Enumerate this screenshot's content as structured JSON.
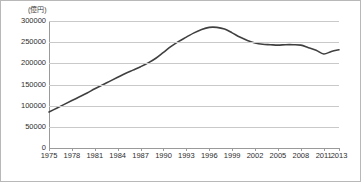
{
  "chart_data": {
    "type": "line",
    "title": "",
    "subtitle": "",
    "unit_label": "(億円)",
    "xlabel": "",
    "ylabel": "",
    "ylim": [
      0,
      300000
    ],
    "ytick_values": [
      0,
      50000,
      100000,
      150000,
      200000,
      250000,
      300000
    ],
    "ytick_labels": [
      "0",
      "50000",
      "100000",
      "150000",
      "200000",
      "250000",
      "300000"
    ],
    "xlim": [
      1975,
      2013
    ],
    "xtick_labels": [
      "1975",
      "1978",
      "1981",
      "1984",
      "1987",
      "1990",
      "1993",
      "1996",
      "1999",
      "2002",
      "2005",
      "2008",
      "2011",
      "2013"
    ],
    "xtick_values": [
      1975,
      1978,
      1981,
      1984,
      1987,
      1990,
      1993,
      1996,
      1999,
      2002,
      2005,
      2008,
      2011,
      2013
    ],
    "grid": true,
    "legend": false,
    "legend_position": "none",
    "line_color": "#404040",
    "series": [
      {
        "name": "",
        "x": [
          1975,
          1976,
          1977,
          1978,
          1979,
          1980,
          1981,
          1982,
          1983,
          1984,
          1985,
          1986,
          1987,
          1988,
          1989,
          1990,
          1991,
          1992,
          1993,
          1994,
          1995,
          1996,
          1997,
          1998,
          1999,
          2000,
          2001,
          2002,
          2003,
          2004,
          2005,
          2006,
          2007,
          2008,
          2009,
          2010,
          2011,
          2012,
          2013
        ],
        "values": [
          85000,
          94000,
          103000,
          112000,
          121000,
          130000,
          140000,
          149000,
          158000,
          167000,
          176000,
          184000,
          192000,
          201000,
          212000,
          226000,
          240000,
          252000,
          262000,
          272000,
          280000,
          285000,
          285000,
          281000,
          272000,
          262000,
          254000,
          248000,
          245000,
          244000,
          243000,
          244000,
          244000,
          243000,
          237000,
          231000,
          222000,
          228000,
          232000
        ]
      }
    ]
  }
}
